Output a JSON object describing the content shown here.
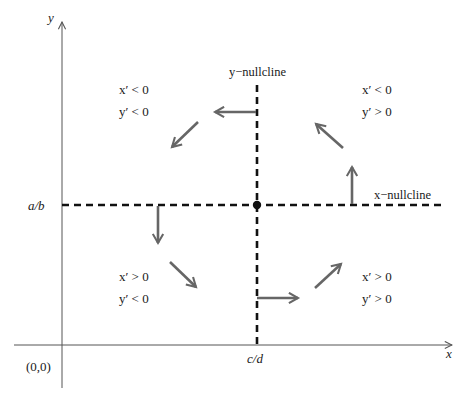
{
  "diagram": {
    "type": "phase-plane",
    "axes": {
      "x_label": "x",
      "y_label": "y",
      "origin_label": "(0,0)",
      "x_tick_label": "c/d",
      "y_tick_label": "a/b"
    },
    "nullclines": {
      "y_nullcline_label": "y−nullcline",
      "x_nullcline_label": "x−nullcline"
    },
    "equilibrium": {
      "label": "",
      "x": "c/d",
      "y": "a/b"
    },
    "regions": {
      "top_left": {
        "line1": "x′ < 0",
        "line2": "y′ < 0"
      },
      "top_right": {
        "line1": "x′ < 0",
        "line2": "y′ > 0"
      },
      "bottom_left": {
        "line1": "x′ > 0",
        "line2": "y′ < 0"
      },
      "bottom_right": {
        "line1": "x′ > 0",
        "line2": "y′ > 0"
      }
    },
    "flow_arrows": [
      {
        "id": "on-y-nullcline-top",
        "direction": "left"
      },
      {
        "id": "top-left-region",
        "direction": "down-left"
      },
      {
        "id": "on-x-nullcline-left",
        "direction": "down"
      },
      {
        "id": "bottom-left-region",
        "direction": "down-right"
      },
      {
        "id": "on-y-nullcline-bottom",
        "direction": "right"
      },
      {
        "id": "bottom-right-region",
        "direction": "up-right"
      },
      {
        "id": "on-x-nullcline-right",
        "direction": "up"
      },
      {
        "id": "top-right-region",
        "direction": "up-left"
      }
    ],
    "colors": {
      "nullcline": "#111111",
      "arrow": "#666666",
      "axis": "#555555",
      "text": "#1a1a1a"
    }
  }
}
